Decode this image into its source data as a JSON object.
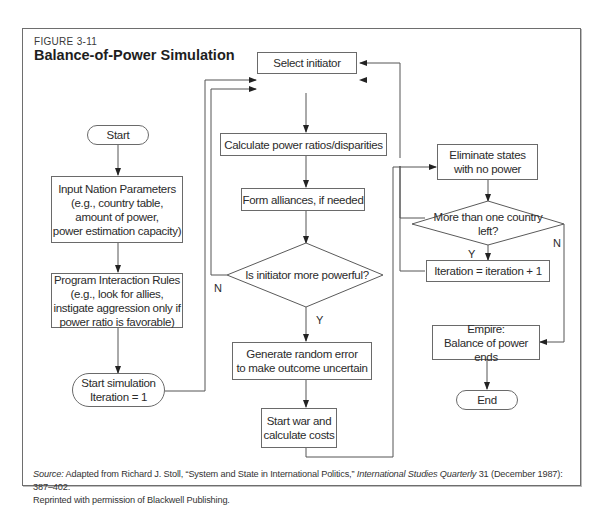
{
  "figure": {
    "label": "FIGURE 3-11",
    "title": "Balance-of-Power Simulation"
  },
  "nodes": {
    "start": "Start",
    "input_params": "Input Nation Parameters\n(e.g., country table,\namount of power,\npower estimation capacity)",
    "interaction_rules": "Program Interaction Rules\n(e.g., look for allies,\ninstigate aggression only if\npower ratio is favorable)",
    "start_sim": "Start simulation\nIteration = 1",
    "select_initiator": "Select initiator",
    "calc_ratios": "Calculate power ratios/disparities",
    "form_alliances": "Form alliances, if needed",
    "decision_powerful": "Is initiator more powerful?",
    "random_error": "Generate random error\nto make outcome uncertain",
    "start_war": "Start war and\ncalculate costs",
    "eliminate_states": "Eliminate states\nwith no power",
    "decision_countries": "More than one country\nleft?",
    "iteration_inc": "Iteration = iteration + 1",
    "empire": "Empire:\nBalance of power ends",
    "end": "End"
  },
  "edge_labels": {
    "powerful_no": "N",
    "powerful_yes": "Y",
    "countries_yes": "Y",
    "countries_no": "N"
  },
  "source": {
    "prefix": "Source:",
    "text1": " Adapted from Richard J. Stoll, “System and State in International Politics,” ",
    "journal": "International Studies Quarterly",
    "text2": " 31 (December 1987): 387–402.",
    "line2": "Reprinted with permission of Blackwell Publishing."
  },
  "colors": {
    "line": "#555555",
    "border": "#6a6a6a",
    "text": "#2b2b2b"
  }
}
